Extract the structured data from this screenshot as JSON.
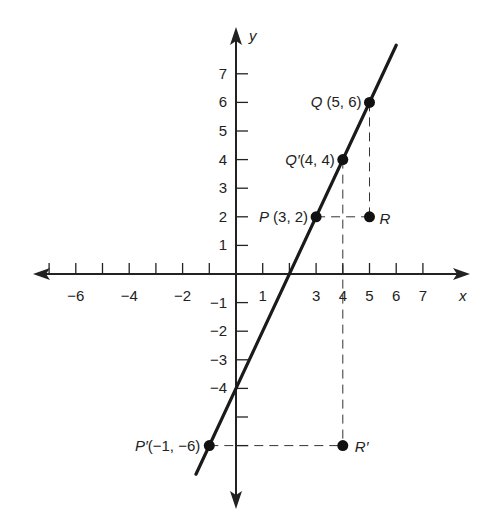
{
  "figure": {
    "type": "coordinate-plane",
    "axes": {
      "x_label": "x",
      "y_label": "y",
      "x_ticks": [
        {
          "v": -7,
          "label": ""
        },
        {
          "v": -6,
          "label": "−6"
        },
        {
          "v": -5,
          "label": ""
        },
        {
          "v": -4,
          "label": "−4"
        },
        {
          "v": -3,
          "label": ""
        },
        {
          "v": -2,
          "label": "−2"
        },
        {
          "v": -1,
          "label": ""
        },
        {
          "v": 1,
          "label": "1"
        },
        {
          "v": 2,
          "label": ""
        },
        {
          "v": 3,
          "label": "3"
        },
        {
          "v": 4,
          "label": "4"
        },
        {
          "v": 5,
          "label": "5"
        },
        {
          "v": 6,
          "label": "6"
        },
        {
          "v": 7,
          "label": "7"
        }
      ],
      "y_ticks": [
        {
          "v": 7,
          "label": "7"
        },
        {
          "v": 6,
          "label": "6"
        },
        {
          "v": 5,
          "label": "5"
        },
        {
          "v": 4,
          "label": "4"
        },
        {
          "v": 3,
          "label": "3"
        },
        {
          "v": 2,
          "label": "2"
        },
        {
          "v": 1,
          "label": "1"
        },
        {
          "v": -1,
          "label": "−1"
        },
        {
          "v": -2,
          "label": "−2"
        },
        {
          "v": -3,
          "label": "−3"
        },
        {
          "v": -4,
          "label": "−4"
        },
        {
          "v": -5,
          "label": ""
        },
        {
          "v": -6,
          "label": ""
        }
      ]
    },
    "line": {
      "equation": "y = 2x - 4",
      "x_from": -1.5,
      "x_to": 6.0
    },
    "points": [
      {
        "name": "Q",
        "x": 5,
        "y": 6,
        "label": "Q (5, 6)"
      },
      {
        "name": "Q'",
        "x": 4,
        "y": 4,
        "label": "Q′(4, 4)"
      },
      {
        "name": "P",
        "x": 3,
        "y": 2,
        "label": "P (3, 2)"
      },
      {
        "name": "R",
        "x": 5,
        "y": 2,
        "label": "R"
      },
      {
        "name": "P'",
        "x": -1,
        "y": -6,
        "label": "P′(−1, −6)"
      },
      {
        "name": "R'",
        "x": 4,
        "y": -6,
        "label": "R′"
      }
    ],
    "dashed_segments": [
      {
        "from": [
          3,
          2
        ],
        "to": [
          5,
          2
        ]
      },
      {
        "from": [
          5,
          6
        ],
        "to": [
          5,
          2
        ]
      },
      {
        "from": [
          -1,
          -6
        ],
        "to": [
          4,
          -6
        ]
      },
      {
        "from": [
          4,
          4
        ],
        "to": [
          4,
          -6
        ]
      }
    ]
  },
  "chart_data": {
    "type": "line",
    "title": "",
    "xlabel": "x",
    "ylabel": "y",
    "xlim": [
      -7,
      7
    ],
    "ylim": [
      -7,
      7
    ],
    "grid": false,
    "series": [
      {
        "name": "line through P'(-1,-6), P(3,2), Q'(4,4), Q(5,6)",
        "x": [
          -1,
          3,
          4,
          5
        ],
        "y": [
          -6,
          2,
          4,
          6
        ]
      }
    ],
    "points": [
      {
        "label": "Q",
        "x": 5,
        "y": 6
      },
      {
        "label": "Q'",
        "x": 4,
        "y": 4
      },
      {
        "label": "P",
        "x": 3,
        "y": 2
      },
      {
        "label": "R",
        "x": 5,
        "y": 2
      },
      {
        "label": "P'",
        "x": -1,
        "y": -6
      },
      {
        "label": "R'",
        "x": 4,
        "y": -6
      }
    ],
    "annotations": [
      "Q (5, 6)",
      "Q'(4, 4)",
      "P (3, 2)",
      "R",
      "P'(-1, -6)",
      "R'"
    ]
  }
}
